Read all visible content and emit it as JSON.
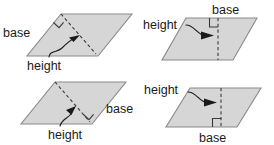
{
  "figure": {
    "colors": {
      "shape_fill": "#d6d6d6",
      "shape_stroke": "#8a8a8a",
      "line": "#1a1a1a",
      "dash": "#3a3a3a",
      "background": "#ffffff"
    },
    "label_text": {
      "base": "base",
      "height": "height"
    },
    "panels": [
      {
        "id": "top-left",
        "base_label": "base",
        "height_label": "height",
        "base_position": "left-slanted-side",
        "height_position": "below",
        "right_angle": "upper-left"
      },
      {
        "id": "top-right",
        "base_label": "base",
        "height_label": "height",
        "base_position": "above-top-side",
        "height_position": "left",
        "right_angle": "upper-right-interior"
      },
      {
        "id": "bottom-left",
        "base_label": "base",
        "height_label": "height",
        "base_position": "right-slanted-side",
        "height_position": "below",
        "right_angle": "lower-right"
      },
      {
        "id": "bottom-right",
        "base_label": "base",
        "height_label": "height",
        "base_position": "below-bottom-side",
        "height_position": "left",
        "right_angle": "lower-right-interior"
      }
    ]
  }
}
